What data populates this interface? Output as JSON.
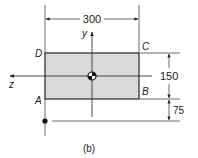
{
  "figure": {
    "caption": "(b)",
    "colors": {
      "fill": "#d9d9d9",
      "stroke": "#333333",
      "line": "#444444"
    },
    "corners": {
      "A": "A",
      "B": "B",
      "C": "C",
      "D": "D"
    },
    "axes": {
      "horizontal": "z",
      "vertical": "y"
    },
    "dimensions": {
      "width": "300",
      "height": "150",
      "offset": "75"
    }
  }
}
